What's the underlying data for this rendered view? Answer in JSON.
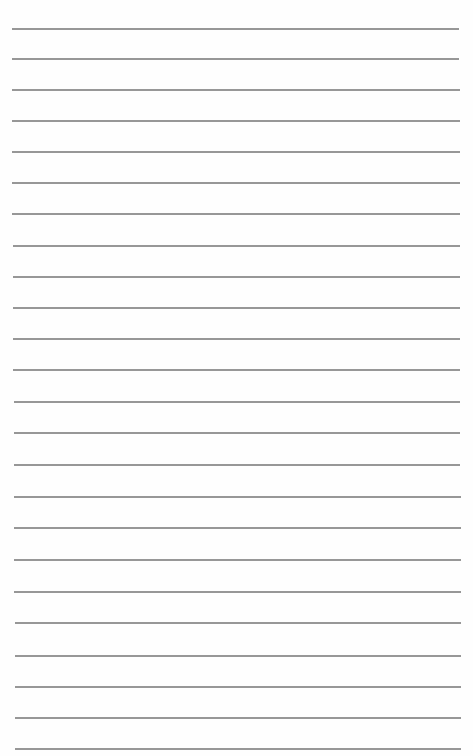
{
  "page": {
    "type": "lined-paper",
    "background": "#fefefe",
    "line_color": "#8c8c8c",
    "line_count": 24,
    "lines": [
      {
        "y": 28,
        "x1": 12,
        "x2": 459
      },
      {
        "y": 58,
        "x1": 12,
        "x2": 459
      },
      {
        "y": 89,
        "x1": 12,
        "x2": 460
      },
      {
        "y": 120,
        "x1": 12,
        "x2": 460
      },
      {
        "y": 151,
        "x1": 12,
        "x2": 460
      },
      {
        "y": 182,
        "x1": 12,
        "x2": 460
      },
      {
        "y": 213,
        "x1": 12,
        "x2": 460
      },
      {
        "y": 245,
        "x1": 13,
        "x2": 460
      },
      {
        "y": 276,
        "x1": 13,
        "x2": 460
      },
      {
        "y": 307,
        "x1": 13,
        "x2": 460
      },
      {
        "y": 338,
        "x1": 13,
        "x2": 460
      },
      {
        "y": 369,
        "x1": 13,
        "x2": 460
      },
      {
        "y": 401,
        "x1": 14,
        "x2": 460
      },
      {
        "y": 432,
        "x1": 14,
        "x2": 460
      },
      {
        "y": 464,
        "x1": 14,
        "x2": 460
      },
      {
        "y": 496,
        "x1": 14,
        "x2": 461
      },
      {
        "y": 527,
        "x1": 14,
        "x2": 461
      },
      {
        "y": 559,
        "x1": 14,
        "x2": 461
      },
      {
        "y": 591,
        "x1": 14,
        "x2": 461
      },
      {
        "y": 622,
        "x1": 15,
        "x2": 461
      },
      {
        "y": 655,
        "x1": 15,
        "x2": 461
      },
      {
        "y": 686,
        "x1": 15,
        "x2": 461
      },
      {
        "y": 717,
        "x1": 15,
        "x2": 461
      },
      {
        "y": 748,
        "x1": 15,
        "x2": 461
      }
    ]
  }
}
